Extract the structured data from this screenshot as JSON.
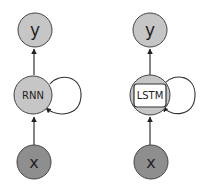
{
  "colors": {
    "light_node": "#c6c6c6",
    "dark_node": "#8e8e8e",
    "stroke": "#333333",
    "inner_box": "#ffffff",
    "background": "#ffffff"
  },
  "diagrams": [
    {
      "name": "rnn",
      "output_label": "y",
      "cell_label": "RNN",
      "input_label": "x"
    },
    {
      "name": "lstm",
      "output_label": "y",
      "cell_label": "LSTM",
      "input_label": "x"
    }
  ]
}
